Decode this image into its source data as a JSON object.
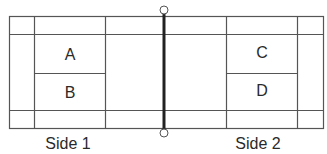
{
  "diagram": {
    "type": "badminton-court",
    "colors": {
      "line": "#555555",
      "net": "#222222",
      "text": "#2a2a2a",
      "background": "#ffffff"
    },
    "zones": [
      {
        "id": "A",
        "label": "A",
        "side": "Side 1",
        "position": "upper service box"
      },
      {
        "id": "B",
        "label": "B",
        "side": "Side 1",
        "position": "lower service box"
      },
      {
        "id": "C",
        "label": "C",
        "side": "Side 2",
        "position": "upper service box"
      },
      {
        "id": "D",
        "label": "D",
        "side": "Side 2",
        "position": "lower service box"
      }
    ],
    "sides": [
      {
        "label": "Side 1"
      },
      {
        "label": "Side 2"
      }
    ],
    "net": {
      "label": "net",
      "posts": [
        "top-post",
        "bottom-post"
      ]
    }
  }
}
